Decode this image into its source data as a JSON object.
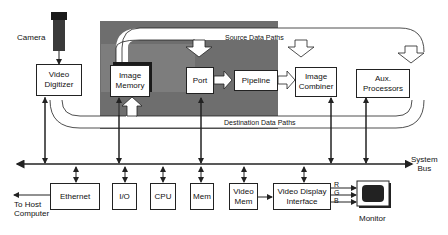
{
  "diagram": {
    "components": {
      "camera": "Camera",
      "video_digitizer": "Video\nDigitizer",
      "image_memory": "Image\nMemory",
      "port": "Port",
      "pipeline": "Pipeline",
      "image_combiner": "Image\nCombiner",
      "aux_processors": "Aux.\nProcessors",
      "ethernet": "Ethernet",
      "io": "I/O",
      "cpu": "CPU",
      "mem": "Mem",
      "video_mem": "Video\nMem",
      "video_display_interface": "Video Display\nInterface",
      "monitor": "Monitor"
    },
    "labels": {
      "source_data_paths": "Source Data Paths",
      "destination_data_paths": "Destination Data Paths",
      "system_bus": "System\nBus",
      "to_host": "To Host\nComputer",
      "r": "R",
      "g": "G",
      "b": "B"
    },
    "colors": {
      "shaded_region": "#6e6e6e",
      "inner_shade": "#8a8a8a",
      "line": "#222222"
    }
  }
}
